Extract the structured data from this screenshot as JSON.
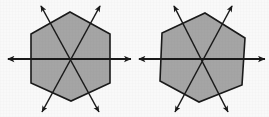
{
  "figure": {
    "title": "Lines of symmetry of a regular hexagon",
    "background_color": "#ffffff",
    "stroke_color": "#1a1a1a",
    "fill_color": "#a9a9a9",
    "canvas": {
      "width": 269,
      "height": 117
    },
    "shape_count": 2,
    "shapes": [
      {
        "id": "left-hexagon",
        "label": "Hexagon with three lines of symmetry",
        "sides": 6,
        "center": {
          "x": 70,
          "y": 59
        },
        "rotation_degrees": 0,
        "vertices": [
          {
            "x": 70,
            "y": 12
          },
          {
            "x": 110,
            "y": 34
          },
          {
            "x": 110,
            "y": 83
          },
          {
            "x": 71,
            "y": 101
          },
          {
            "x": 31,
            "y": 83
          },
          {
            "x": 31,
            "y": 34
          }
        ],
        "axes": [
          {
            "id": "horizontal-axis",
            "angle_degrees": 0,
            "from": {
              "x": 8,
              "y": 59
            },
            "to": {
              "x": 131,
              "y": 59
            },
            "arrows": "both"
          },
          {
            "id": "axis-ne-sw",
            "angle_degrees": 60,
            "from": {
              "x": 41,
              "y": 6
            },
            "to": {
              "x": 99,
              "y": 112
            },
            "arrows": "both"
          },
          {
            "id": "axis-nw-se",
            "angle_degrees": 120,
            "from": {
              "x": 100,
              "y": 6
            },
            "to": {
              "x": 42,
              "y": 112
            },
            "arrows": "both"
          }
        ]
      },
      {
        "id": "right-hexagon",
        "label": "Rotated hexagon with three lines of symmetry",
        "sides": 6,
        "center": {
          "x": 202,
          "y": 59
        },
        "rotation_degrees": -6,
        "vertices": [
          {
            "x": 205,
            "y": 13
          },
          {
            "x": 245,
            "y": 38
          },
          {
            "x": 242,
            "y": 85
          },
          {
            "x": 199,
            "y": 102
          },
          {
            "x": 160,
            "y": 81
          },
          {
            "x": 162,
            "y": 33
          }
        ],
        "axes": [
          {
            "id": "horizontal-axis",
            "angle_degrees": 0,
            "from": {
              "x": 139,
              "y": 59
            },
            "to": {
              "x": 265,
              "y": 59
            },
            "arrows": "both"
          },
          {
            "id": "axis-ne-sw",
            "angle_degrees": 62,
            "from": {
              "x": 174,
              "y": 6
            },
            "to": {
              "x": 228,
              "y": 112
            },
            "arrows": "both"
          },
          {
            "id": "axis-nw-se",
            "angle_degrees": 118,
            "from": {
              "x": 232,
              "y": 6
            },
            "to": {
              "x": 175,
              "y": 112
            },
            "arrows": "both"
          }
        ]
      }
    ],
    "notes": {
      "axis_count_per_shape": 3,
      "arrow_style": "double-headed",
      "texture": "grainy halftone gray fill"
    }
  }
}
